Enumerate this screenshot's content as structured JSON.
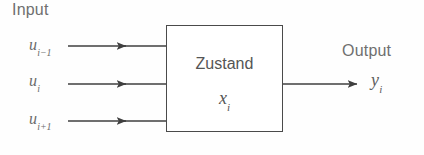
{
  "diagram": {
    "type": "block-diagram",
    "title_caption_left": "Input",
    "title_caption_right": "Output",
    "background_color": "#fefefe",
    "line_color": "#3f3f3f",
    "text_color_sans": "#6f6f6f",
    "text_color_math": "#6b6b6b",
    "box": {
      "label": "Zustand",
      "state_variable_base": "x",
      "state_variable_subscript": "i",
      "x": 166,
      "y": 25,
      "width": 117,
      "height": 107,
      "border_color": "#4a4a4a"
    },
    "inputs": [
      {
        "name": "input-u-i-minus-1",
        "base": "u",
        "subscript": "i−1",
        "arrow_y": 46,
        "line_start_x": 68,
        "arrow_head_x": 126,
        "line_end_x": 166
      },
      {
        "name": "input-u-i",
        "base": "u",
        "subscript": "i",
        "arrow_y": 84,
        "line_start_x": 68,
        "arrow_head_x": 126,
        "line_end_x": 166
      },
      {
        "name": "input-u-i-plus-1",
        "base": "u",
        "subscript": "i+1",
        "arrow_y": 121,
        "line_start_x": 68,
        "arrow_head_x": 126,
        "line_end_x": 166
      }
    ],
    "output": {
      "name": "output-y-i",
      "base": "y",
      "subscript": "i",
      "arrow_y": 84,
      "line_start_x": 283,
      "arrow_head_x": 357
    }
  }
}
